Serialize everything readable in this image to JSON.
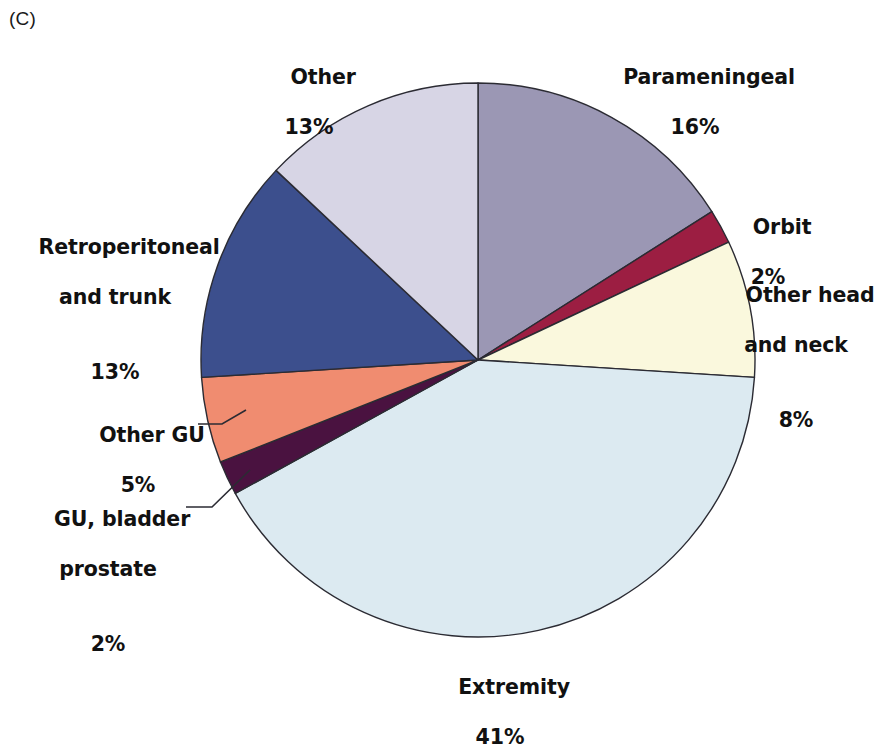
{
  "panel": {
    "tag": "(C)"
  },
  "chart_data": {
    "type": "pie",
    "title": "",
    "subtitle": "",
    "xlabel": "",
    "ylabel": "",
    "legend_position": "none",
    "grid": false,
    "units": "percent",
    "start_angle_deg": 0,
    "direction": "clockwise",
    "center": {
      "x": 478,
      "y": 360
    },
    "radius": 277,
    "categories": [
      "Parameningeal",
      "Orbit",
      "Other head and neck",
      "Extremity",
      "GU, bladder prostate",
      "Other GU",
      "Retroperitoneal and trunk",
      "Other"
    ],
    "values": [
      16,
      2,
      8,
      41,
      2,
      5,
      13,
      13
    ],
    "colors": [
      "#9b97b4",
      "#9c1e42",
      "#faf8dd",
      "#dceaf1",
      "#4a1240",
      "#f08c70",
      "#3c4f8d",
      "#d7d5e5"
    ],
    "slices": [
      {
        "label": "Parameningeal",
        "value": 16,
        "value_text": "16%",
        "color": "#9b97b4"
      },
      {
        "label": "Orbit",
        "value": 2,
        "value_text": "2%",
        "color": "#9c1e42"
      },
      {
        "label": "Other head and neck",
        "value": 8,
        "value_text": "8%",
        "color": "#faf8dd"
      },
      {
        "label": "Extremity",
        "value": 41,
        "value_text": "41%",
        "color": "#dceaf1"
      },
      {
        "label": "GU, bladder prostate",
        "value": 2,
        "value_text": "2%",
        "color": "#4a1240"
      },
      {
        "label": "Other GU",
        "value": 5,
        "value_text": "5%",
        "color": "#f08c70"
      },
      {
        "label": "Retroperitoneal and trunk",
        "value": 13,
        "value_text": "13%",
        "color": "#3c4f8d"
      },
      {
        "label": "Other",
        "value": 13,
        "value_text": "13%",
        "color": "#d7d5e5"
      }
    ]
  },
  "labels": {
    "other": {
      "line1": "Other",
      "line2": "",
      "pct": "13%"
    },
    "parameningeal": {
      "line1": "Parameningeal",
      "line2": "",
      "pct": "16%"
    },
    "orbit": {
      "line1": "Orbit",
      "line2": "",
      "pct": "2%"
    },
    "other_head_neck": {
      "line1": "Other head",
      "line2": "and neck",
      "pct": "8%"
    },
    "retroperitoneal": {
      "line1": "Retroperitoneal",
      "line2": "and trunk",
      "pct": "13%"
    },
    "other_gu": {
      "line1": "Other GU",
      "line2": "",
      "pct": "5%"
    },
    "gu_bladder": {
      "line1": "GU, bladder",
      "line2": "prostate",
      "pct": "2%"
    },
    "extremity": {
      "line1": "Extremity",
      "line2": "",
      "pct": "41%"
    }
  },
  "style": {
    "slice_outline": "#2b2b33",
    "leader_line": "#2b2b33",
    "background": "#ffffff",
    "text_color": "#111111"
  }
}
